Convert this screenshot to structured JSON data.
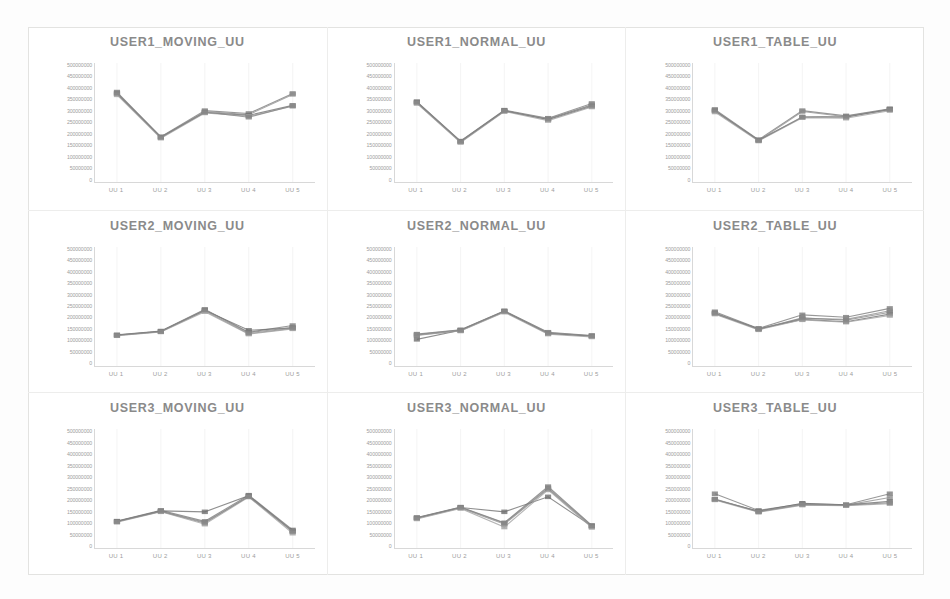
{
  "page": {
    "background_color": "#ffffff",
    "frame_color": "#e3e3e1",
    "title_color": "#8a8a8a",
    "axis_label_color": "#9d9d9d",
    "grid_color": "#ececec",
    "layout": "3x3 grid of line charts"
  },
  "axis": {
    "y_tick_labels": [
      "500000000",
      "450000000",
      "400000000",
      "350000000",
      "300000000",
      "250000000",
      "200000000",
      "150000000",
      "100000000",
      "50000000",
      "0"
    ],
    "x_tick_labels": [
      "UU 1",
      "UU 2",
      "UU 3",
      "UU 4",
      "UU 5"
    ],
    "ylim": [
      0,
      500000000
    ],
    "grid": "vertical-only"
  },
  "series_colors": [
    "#7b7b7b",
    "#8f8f8f",
    "#6f6f6f",
    "#a0a0a0",
    "#868686"
  ],
  "chart_data": [
    {
      "type": "line",
      "title": "USER1_MOVING_UU",
      "xlabel": "",
      "ylabel": "",
      "categories": [
        "UU 1",
        "UU 2",
        "UU 3",
        "UU 4",
        "UU 5"
      ],
      "ylim": [
        0,
        500000000
      ],
      "grid": "vertical",
      "legend": "none",
      "series": [
        {
          "name": "s1",
          "values": [
            378000000,
            190000000,
            300000000,
            288000000,
            372000000
          ]
        },
        {
          "name": "s2",
          "values": [
            370000000,
            186000000,
            296000000,
            283000000,
            368000000
          ]
        },
        {
          "name": "s3",
          "values": [
            372000000,
            188000000,
            292000000,
            280000000,
            322000000
          ]
        },
        {
          "name": "s4",
          "values": [
            366000000,
            184000000,
            290000000,
            276000000,
            318000000
          ]
        },
        {
          "name": "s5",
          "values": [
            374000000,
            189000000,
            294000000,
            272000000,
            320000000
          ]
        }
      ]
    },
    {
      "type": "line",
      "title": "USER1_NORMAL_UU",
      "xlabel": "",
      "ylabel": "",
      "categories": [
        "UU 1",
        "UU 2",
        "UU 3",
        "UU 4",
        "UU 5"
      ],
      "ylim": [
        0,
        500000000
      ],
      "grid": "vertical",
      "legend": "none",
      "series": [
        {
          "name": "s1",
          "values": [
            338000000,
            172000000,
            302000000,
            268000000,
            330000000
          ]
        },
        {
          "name": "s2",
          "values": [
            332000000,
            168000000,
            298000000,
            264000000,
            325000000
          ]
        },
        {
          "name": "s3",
          "values": [
            335000000,
            170000000,
            300000000,
            262000000,
            318000000
          ]
        },
        {
          "name": "s4",
          "values": [
            330000000,
            166000000,
            296000000,
            258000000,
            315000000
          ]
        },
        {
          "name": "s5",
          "values": [
            336000000,
            171000000,
            299000000,
            266000000,
            322000000
          ]
        }
      ]
    },
    {
      "type": "line",
      "title": "USER1_TABLE_UU",
      "xlabel": "",
      "ylabel": "",
      "categories": [
        "UU 1",
        "UU 2",
        "UU 3",
        "UU 4",
        "UU 5"
      ],
      "ylim": [
        0,
        500000000
      ],
      "grid": "vertical",
      "legend": "none",
      "series": [
        {
          "name": "s1",
          "values": [
            305000000,
            178000000,
            300000000,
            278000000,
            308000000
          ]
        },
        {
          "name": "s2",
          "values": [
            298000000,
            174000000,
            296000000,
            274000000,
            304000000
          ]
        },
        {
          "name": "s3",
          "values": [
            300000000,
            176000000,
            272000000,
            272000000,
            306000000
          ]
        },
        {
          "name": "s4",
          "values": [
            294000000,
            172000000,
            270000000,
            268000000,
            300000000
          ]
        },
        {
          "name": "s5",
          "values": [
            302000000,
            175000000,
            274000000,
            276000000,
            305000000
          ]
        }
      ]
    },
    {
      "type": "line",
      "title": "USER2_MOVING_UU",
      "xlabel": "",
      "ylabel": "",
      "categories": [
        "UU 1",
        "UU 2",
        "UU 3",
        "UU 4",
        "UU 5"
      ],
      "ylim": [
        0,
        500000000
      ],
      "grid": "vertical",
      "legend": "none",
      "series": [
        {
          "name": "s1",
          "values": [
            131000000,
            147000000,
            238000000,
            142000000,
            170000000
          ]
        },
        {
          "name": "s2",
          "values": [
            128000000,
            144000000,
            232000000,
            136000000,
            158000000
          ]
        },
        {
          "name": "s3",
          "values": [
            130000000,
            146000000,
            234000000,
            150000000,
            160000000
          ]
        },
        {
          "name": "s4",
          "values": [
            127000000,
            143000000,
            228000000,
            134000000,
            156000000
          ]
        },
        {
          "name": "s5",
          "values": [
            129000000,
            145000000,
            236000000,
            140000000,
            162000000
          ]
        }
      ]
    },
    {
      "type": "line",
      "title": "USER2_NORMAL_UU",
      "xlabel": "",
      "ylabel": "",
      "categories": [
        "UU 1",
        "UU 2",
        "UU 3",
        "UU 4",
        "UU 5"
      ],
      "ylim": [
        0,
        500000000
      ],
      "grid": "vertical",
      "legend": "none",
      "series": [
        {
          "name": "s1",
          "values": [
            134000000,
            152000000,
            232000000,
            142000000,
            128000000
          ]
        },
        {
          "name": "s2",
          "values": [
            128000000,
            148000000,
            228000000,
            138000000,
            124000000
          ]
        },
        {
          "name": "s3",
          "values": [
            112000000,
            150000000,
            230000000,
            136000000,
            126000000
          ]
        },
        {
          "name": "s4",
          "values": [
            130000000,
            147000000,
            226000000,
            134000000,
            122000000
          ]
        },
        {
          "name": "s5",
          "values": [
            132000000,
            151000000,
            231000000,
            140000000,
            127000000
          ]
        }
      ]
    },
    {
      "type": "line",
      "title": "USER2_TABLE_UU",
      "xlabel": "",
      "ylabel": "",
      "categories": [
        "UU 1",
        "UU 2",
        "UU 3",
        "UU 4",
        "UU 5"
      ],
      "ylim": [
        0,
        500000000
      ],
      "grid": "vertical",
      "legend": "none",
      "series": [
        {
          "name": "s1",
          "values": [
            228000000,
            158000000,
            215000000,
            205000000,
            242000000
          ]
        },
        {
          "name": "s2",
          "values": [
            222000000,
            154000000,
            200000000,
            196000000,
            232000000
          ]
        },
        {
          "name": "s3",
          "values": [
            220000000,
            156000000,
            196000000,
            186000000,
            218000000
          ]
        },
        {
          "name": "s4",
          "values": [
            218000000,
            152000000,
            194000000,
            184000000,
            212000000
          ]
        },
        {
          "name": "s5",
          "values": [
            224000000,
            155000000,
            202000000,
            192000000,
            226000000
          ]
        }
      ]
    },
    {
      "type": "line",
      "title": "USER3_MOVING_UU",
      "xlabel": "",
      "ylabel": "",
      "categories": [
        "UU 1",
        "UU 2",
        "UU 3",
        "UU 4",
        "UU 5"
      ],
      "ylim": [
        0,
        500000000
      ],
      "grid": "vertical",
      "legend": "none",
      "series": [
        {
          "name": "s1",
          "values": [
            113000000,
            158000000,
            112000000,
            222000000,
            76000000
          ]
        },
        {
          "name": "s2",
          "values": [
            110000000,
            154000000,
            104000000,
            218000000,
            68000000
          ]
        },
        {
          "name": "s3",
          "values": [
            112000000,
            156000000,
            152000000,
            220000000,
            72000000
          ]
        },
        {
          "name": "s4",
          "values": [
            108000000,
            152000000,
            100000000,
            214000000,
            62000000
          ]
        },
        {
          "name": "s5",
          "values": [
            111000000,
            155000000,
            108000000,
            216000000,
            70000000
          ]
        }
      ]
    },
    {
      "type": "line",
      "title": "USER3_NORMAL_UU",
      "xlabel": "",
      "ylabel": "",
      "categories": [
        "UU 1",
        "UU 2",
        "UU 3",
        "UU 4",
        "UU 5"
      ],
      "ylim": [
        0,
        500000000
      ],
      "grid": "vertical",
      "legend": "none",
      "series": [
        {
          "name": "s1",
          "values": [
            128000000,
            172000000,
            106000000,
            258000000,
            95000000
          ]
        },
        {
          "name": "s2",
          "values": [
            124000000,
            168000000,
            100000000,
            248000000,
            90000000
          ]
        },
        {
          "name": "s3",
          "values": [
            126000000,
            170000000,
            152000000,
            215000000,
            92000000
          ]
        },
        {
          "name": "s4",
          "values": [
            122000000,
            166000000,
            88000000,
            244000000,
            86000000
          ]
        },
        {
          "name": "s5",
          "values": [
            127000000,
            171000000,
            104000000,
            252000000,
            93000000
          ]
        }
      ]
    },
    {
      "type": "line",
      "title": "USER3_TABLE_UU",
      "xlabel": "",
      "ylabel": "",
      "categories": [
        "UU 1",
        "UU 2",
        "UU 3",
        "UU 4",
        "UU 5"
      ],
      "ylim": [
        0,
        500000000
      ],
      "grid": "vertical",
      "legend": "none",
      "series": [
        {
          "name": "s1",
          "values": [
            228000000,
            158000000,
            186000000,
            182000000,
            228000000
          ]
        },
        {
          "name": "s2",
          "values": [
            205000000,
            152000000,
            182000000,
            180000000,
            212000000
          ]
        },
        {
          "name": "s3",
          "values": [
            203000000,
            155000000,
            188000000,
            181000000,
            196000000
          ]
        },
        {
          "name": "s4",
          "values": [
            202000000,
            150000000,
            180000000,
            178000000,
            186000000
          ]
        },
        {
          "name": "s5",
          "values": [
            206000000,
            153000000,
            184000000,
            180000000,
            190000000
          ]
        }
      ]
    }
  ]
}
